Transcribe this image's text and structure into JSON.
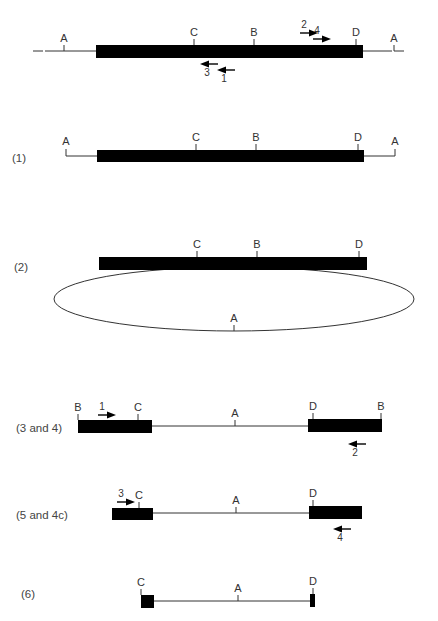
{
  "colors": {
    "ink": "#000000",
    "line": "#333333",
    "text": "#333333",
    "background": "#ffffff"
  },
  "panels": [
    {
      "id": "original",
      "label": "",
      "line": {
        "x1": 33,
        "x2": 404,
        "y": 51,
        "dashed_ends": true
      },
      "bars": [
        {
          "x": 96,
          "y": 45,
          "w": 267,
          "h": 13
        }
      ],
      "sites": [
        {
          "name": "A",
          "x": 64,
          "y": 51,
          "side": "up"
        },
        {
          "name": "C",
          "x": 194,
          "y": 45,
          "side": "up"
        },
        {
          "name": "B",
          "x": 254,
          "y": 45,
          "side": "up"
        },
        {
          "name": "D",
          "x": 356,
          "y": 45,
          "side": "up"
        },
        {
          "name": "A",
          "x": 394,
          "y": 51,
          "side": "up"
        }
      ],
      "primers": [
        {
          "num": "2",
          "x": 300,
          "y": 33,
          "dir": "right",
          "label_pos": "above"
        },
        {
          "num": "4",
          "x": 313,
          "y": 39,
          "dir": "right",
          "label_pos": "above"
        },
        {
          "num": "3",
          "x": 200,
          "y": 64,
          "dir": "left",
          "label_pos": "below"
        },
        {
          "num": "1",
          "x": 217,
          "y": 70,
          "dir": "left",
          "label_pos": "below"
        }
      ]
    },
    {
      "id": "step-1",
      "label": "(1)",
      "label_pos": {
        "x": 12,
        "y": 162
      },
      "line_segments": [
        {
          "x1": 66,
          "x2": 97,
          "y": 156
        },
        {
          "x1": 363,
          "x2": 395,
          "y": 156
        }
      ],
      "end_ticks": [
        {
          "x": 66,
          "y1": 149,
          "y2": 156
        },
        {
          "x": 395,
          "y1": 149,
          "y2": 156
        }
      ],
      "bars": [
        {
          "x": 97,
          "y": 150,
          "w": 267,
          "h": 12
        }
      ],
      "sites": [
        {
          "name": "A",
          "x": 66,
          "y": 149,
          "side": "up",
          "no_tick": true
        },
        {
          "name": "C",
          "x": 196,
          "y": 150,
          "side": "up"
        },
        {
          "name": "B",
          "x": 256,
          "y": 150,
          "side": "up"
        },
        {
          "name": "D",
          "x": 358,
          "y": 150,
          "side": "up"
        },
        {
          "name": "A",
          "x": 395,
          "y": 149,
          "side": "up",
          "no_tick": true
        }
      ],
      "primers": []
    },
    {
      "id": "step-2",
      "label": "(2)",
      "label_pos": {
        "x": 14,
        "y": 271
      },
      "ellipse": {
        "cx": 234,
        "cy": 299,
        "rx": 180,
        "ry": 32
      },
      "bars": [
        {
          "x": 99,
          "y": 257,
          "w": 268,
          "h": 13
        }
      ],
      "sites": [
        {
          "name": "C",
          "x": 197,
          "y": 257,
          "side": "up"
        },
        {
          "name": "B",
          "x": 257,
          "y": 257,
          "side": "up"
        },
        {
          "name": "D",
          "x": 359,
          "y": 257,
          "side": "up"
        },
        {
          "name": "A",
          "x": 234,
          "y": 331,
          "side": "up"
        }
      ],
      "primers": []
    },
    {
      "id": "step-3-4",
      "label": "(3 and 4)",
      "label_pos": {
        "x": 16,
        "y": 432
      },
      "line_segments": [
        {
          "x1": 152,
          "x2": 308,
          "y": 426
        }
      ],
      "bars": [
        {
          "x": 78,
          "y": 420,
          "w": 74,
          "h": 13
        },
        {
          "x": 308,
          "y": 419,
          "w": 74,
          "h": 13
        }
      ],
      "sites": [
        {
          "name": "B",
          "x": 78,
          "y": 420,
          "side": "up"
        },
        {
          "name": "C",
          "x": 138,
          "y": 420,
          "side": "up"
        },
        {
          "name": "A",
          "x": 235,
          "y": 426,
          "side": "up"
        },
        {
          "name": "D",
          "x": 313,
          "y": 419,
          "side": "up"
        },
        {
          "name": "B",
          "x": 381,
          "y": 419,
          "side": "up"
        }
      ],
      "primers": [
        {
          "num": "1",
          "x": 98,
          "y": 415,
          "dir": "right",
          "label_pos": "above"
        },
        {
          "num": "2",
          "x": 348,
          "y": 444,
          "dir": "left",
          "label_pos": "below"
        }
      ]
    },
    {
      "id": "step-5-4c",
      "label": "(5 and 4c)",
      "label_pos": {
        "x": 16,
        "y": 519
      },
      "line_segments": [
        {
          "x1": 153,
          "x2": 309,
          "y": 513
        }
      ],
      "bars": [
        {
          "x": 112,
          "y": 508,
          "w": 41,
          "h": 12
        },
        {
          "x": 309,
          "y": 506,
          "w": 53,
          "h": 13
        }
      ],
      "sites": [
        {
          "name": "C",
          "x": 139,
          "y": 508,
          "side": "up"
        },
        {
          "name": "A",
          "x": 236,
          "y": 513,
          "side": "up"
        },
        {
          "name": "D",
          "x": 313,
          "y": 506,
          "side": "up"
        },
        {
          "name": "A_hidden",
          "x": 0,
          "y": 0,
          "side": "none"
        }
      ],
      "primers": [
        {
          "num": "3",
          "x": 117,
          "y": 502,
          "dir": "right",
          "label_pos": "above"
        },
        {
          "num": "4",
          "x": 333,
          "y": 529,
          "dir": "left",
          "label_pos": "below"
        }
      ]
    },
    {
      "id": "step-6",
      "label": "(6)",
      "label_pos": {
        "x": 21,
        "y": 598
      },
      "line_segments": [
        {
          "x1": 154,
          "x2": 310,
          "y": 601
        }
      ],
      "bars": [
        {
          "x": 141,
          "y": 595,
          "w": 13,
          "h": 13
        },
        {
          "x": 310,
          "y": 594,
          "w": 5,
          "h": 13
        }
      ],
      "sites": [
        {
          "name": "C",
          "x": 141,
          "y": 595,
          "side": "up"
        },
        {
          "name": "A",
          "x": 238,
          "y": 601,
          "side": "up"
        },
        {
          "name": "D",
          "x": 313,
          "y": 594,
          "side": "up"
        }
      ],
      "primers": []
    }
  ]
}
